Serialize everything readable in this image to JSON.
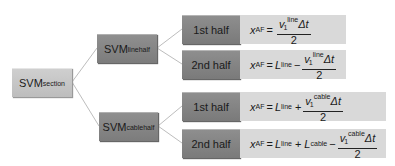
{
  "root": {
    "label": "SVM",
    "subscript": "section"
  },
  "branches": [
    {
      "label": "SVM",
      "subscript": "line",
      "superscript": "half",
      "rows": [
        {
          "half": "1st half",
          "formula": {
            "lhs": "x",
            "lhs_sub": "AF",
            "prefix_terms": [],
            "sign": "",
            "num_v": "v",
            "num_v_sub": "1",
            "num_v_sup": "line",
            "num_tail": "Δt",
            "den": "2"
          }
        },
        {
          "half": "2nd half",
          "formula": {
            "lhs": "x",
            "lhs_sub": "AF",
            "prefix_terms": [
              {
                "L": "L",
                "sub": "line"
              }
            ],
            "sign": "−",
            "num_v": "v",
            "num_v_sub": "1",
            "num_v_sup": "line",
            "num_tail": "Δt",
            "den": "2"
          }
        }
      ]
    },
    {
      "label": "SVM",
      "subscript": "cable",
      "superscript": "half",
      "rows": [
        {
          "half": "1st half",
          "formula": {
            "lhs": "x",
            "lhs_sub": "AF",
            "prefix_terms": [
              {
                "L": "L",
                "sub": "line"
              }
            ],
            "sign": "+",
            "num_v": "v",
            "num_v_sub": "1",
            "num_v_sup": "cable",
            "num_tail": "Δt",
            "den": "2"
          }
        },
        {
          "half": "2nd half",
          "formula": {
            "lhs": "x",
            "lhs_sub": "AF",
            "prefix_terms": [
              {
                "L": "L",
                "sub": "line"
              },
              {
                "L": "L",
                "sub": "cable"
              }
            ],
            "sign": "−",
            "num_v": "v",
            "num_v_sub": "1",
            "num_v_sup": "cable",
            "num_tail": "Δt",
            "den": "2"
          }
        }
      ]
    }
  ],
  "symbols": {
    "equals": "=",
    "plus": "+"
  }
}
